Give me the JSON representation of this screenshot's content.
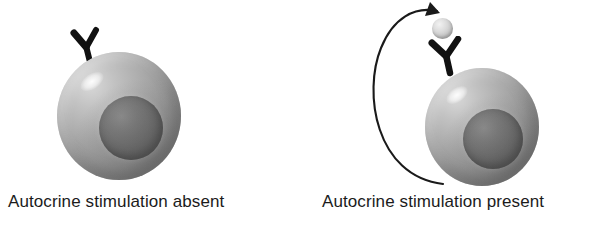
{
  "figure": {
    "type": "biology-diagram",
    "background_color": "#ffffff"
  },
  "panels": [
    {
      "id": "left",
      "caption": "Autocrine stimulation absent",
      "cell": {
        "label": "tumor-cell",
        "body_color": "#a8a8a8",
        "nucleus_color": "#6e6e6e",
        "highlight_color": "#ffffff"
      },
      "receptor": {
        "label": "growth-factor-receptor",
        "color": "#111111",
        "shape": "Y"
      },
      "ligand_present": false,
      "arrow_present": false
    },
    {
      "id": "right",
      "caption": "Autocrine stimulation present",
      "cell": {
        "label": "tumor-cell",
        "body_color": "#a8a8a8",
        "nucleus_color": "#6e6e6e",
        "highlight_color": "#ffffff"
      },
      "receptor": {
        "label": "growth-factor-receptor",
        "color": "#111111",
        "shape": "Y"
      },
      "ligand_present": true,
      "ligand": {
        "label": "growth-factor-ligand",
        "color": "#dcdcdc"
      },
      "arrow_present": true,
      "arrow": {
        "label": "autocrine-secretion-loop",
        "color": "#1a1a1a",
        "style": "curved-arc-with-arrowhead",
        "direction": "from cell base, around left, to ligand at top"
      }
    }
  ]
}
